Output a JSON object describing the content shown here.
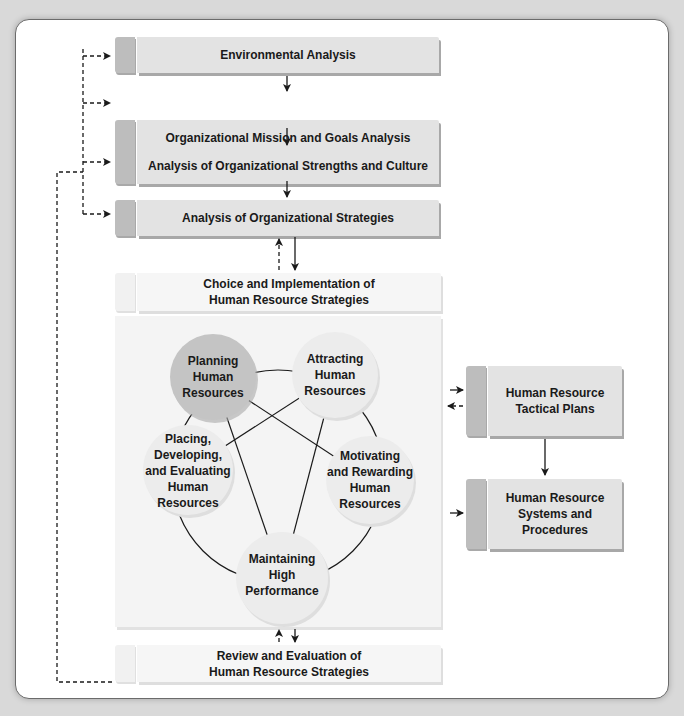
{
  "diagram": {
    "flow_boxes": [
      {
        "id": "environmental",
        "label": "Environmental Analysis"
      },
      {
        "id": "mission",
        "label": "Organizational Mission and Goals Analysis"
      },
      {
        "id": "strengths",
        "label": "Analysis of Organizational Strengths and Culture"
      },
      {
        "id": "strategies",
        "label": "Analysis of Organizational Strategies"
      }
    ],
    "choice_box": {
      "line1": "Choice and Implementation of",
      "line2": "Human Resource Strategies"
    },
    "review_box": {
      "line1": "Review and Evaluation of",
      "line2": "Human Resource Strategies"
    },
    "circles": [
      {
        "id": "planning",
        "lines": [
          "Planning",
          "Human",
          "Resources"
        ],
        "color": "#c4c4c4"
      },
      {
        "id": "attracting",
        "lines": [
          "Attracting",
          "Human",
          "Resources"
        ],
        "color": "#e9e9e9"
      },
      {
        "id": "placing",
        "lines": [
          "Placing,",
          "Developing,",
          "and Evaluating",
          "Human",
          "Resources"
        ],
        "color": "#e9e9e9"
      },
      {
        "id": "motivating",
        "lines": [
          "Motivating",
          "and Rewarding",
          "Human",
          "Resources"
        ],
        "color": "#e9e9e9"
      },
      {
        "id": "maintaining",
        "lines": [
          "Maintaining",
          "High",
          "Performance"
        ],
        "color": "#e9e9e9"
      }
    ],
    "right_boxes": [
      {
        "id": "tactical",
        "line1": "Human Resource",
        "line2": "Tactical Plans"
      },
      {
        "id": "systems",
        "line1": "Human Resource",
        "line2": "Systems and",
        "line3": "Procedures"
      }
    ]
  },
  "colors": {
    "background": "#d9d9d9",
    "card": "#ffffff",
    "box_tab": "#bdbdbd",
    "box_body": "#e3e3e3",
    "light_box": "#f6f6f6",
    "panel": "#f4f4f4",
    "line": "#1a1a1a"
  }
}
